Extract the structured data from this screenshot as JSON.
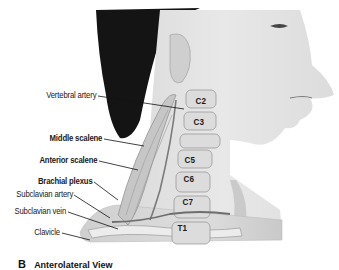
{
  "figure": {
    "labels": [
      {
        "text": "Vertebral artery",
        "bold": false
      },
      {
        "text": "Middle scalene",
        "bold": true
      },
      {
        "text": "Anterior scalene",
        "bold": true
      },
      {
        "text": "Brachial plexus",
        "bold": true
      },
      {
        "text": "Subclavian artery",
        "bold": false
      },
      {
        "text": "Subclavian vein",
        "bold": false
      },
      {
        "text": "Clavicle",
        "bold": false
      }
    ],
    "vertebrae": [
      "C2",
      "C3",
      "C5",
      "C6",
      "C7",
      "T1"
    ],
    "caption": {
      "letter": "B",
      "text": "Anterolateral View"
    }
  }
}
